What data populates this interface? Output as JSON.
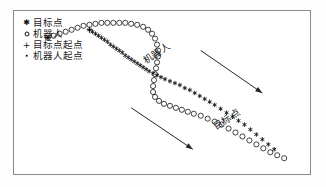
{
  "figure": {
    "background_color": "#ffffff",
    "frame_color": "#8a8a8a",
    "marker_color": "#111111"
  },
  "legend": {
    "items": [
      {
        "marker": "star-marker-icon",
        "label": "目标点"
      },
      {
        "marker": "circle-marker-icon",
        "label": "机器人"
      },
      {
        "marker": "plus-marker-icon",
        "label": "目标点起点"
      },
      {
        "marker": "dot-marker-icon",
        "label": "机器人起点"
      }
    ]
  },
  "annotations": [
    {
      "name": "robot-arrow",
      "label": "机器人"
    },
    {
      "name": "target-arrow",
      "label": "目标点"
    }
  ],
  "chart_data": {
    "type": "scatter",
    "title": "",
    "xlabel": "",
    "ylabel": "",
    "grid": false,
    "legend_position": "top-left",
    "xlim": [
      0,
      298
    ],
    "ylim": [
      0,
      165
    ],
    "series": [
      {
        "name": "目标点",
        "marker": "star",
        "color": "#111111",
        "points": [
          [
            76,
            146
          ],
          [
            79,
            144
          ],
          [
            82,
            142
          ],
          [
            85,
            140
          ],
          [
            88,
            138
          ],
          [
            91,
            136
          ],
          [
            94,
            134
          ],
          [
            97,
            131
          ],
          [
            100,
            129
          ],
          [
            103,
            127
          ],
          [
            106,
            125
          ],
          [
            109,
            123
          ],
          [
            112,
            120
          ],
          [
            115,
            118
          ],
          [
            118,
            116
          ],
          [
            121,
            114
          ],
          [
            124,
            112
          ],
          [
            127,
            110
          ],
          [
            130,
            108
          ],
          [
            133,
            106
          ],
          [
            136,
            104
          ],
          [
            140,
            102
          ],
          [
            144,
            100
          ],
          [
            148,
            98
          ],
          [
            152,
            96
          ],
          [
            157,
            94
          ],
          [
            162,
            92
          ],
          [
            167,
            90
          ],
          [
            172,
            87
          ],
          [
            177,
            85
          ],
          [
            182,
            82
          ],
          [
            187,
            79
          ],
          [
            192,
            76
          ],
          [
            197,
            73
          ],
          [
            202,
            70
          ],
          [
            208,
            66
          ],
          [
            214,
            62
          ],
          [
            220,
            58
          ],
          [
            226,
            54
          ],
          [
            232,
            50
          ],
          [
            238,
            45
          ],
          [
            244,
            40
          ],
          [
            250,
            35
          ],
          [
            256,
            30
          ],
          [
            262,
            25
          ]
        ]
      },
      {
        "name": "机器人",
        "marker": "circle",
        "color": "#111111",
        "points": [
          [
            34,
            138
          ],
          [
            40,
            140
          ],
          [
            46,
            142
          ],
          [
            52,
            144
          ],
          [
            58,
            146
          ],
          [
            64,
            148
          ],
          [
            70,
            150
          ],
          [
            76,
            151
          ],
          [
            82,
            152
          ],
          [
            88,
            153
          ],
          [
            94,
            153
          ],
          [
            100,
            153
          ],
          [
            106,
            153
          ],
          [
            112,
            153
          ],
          [
            118,
            152
          ],
          [
            124,
            151
          ],
          [
            130,
            149
          ],
          [
            135,
            146
          ],
          [
            139,
            142
          ],
          [
            142,
            137
          ],
          [
            144,
            131
          ],
          [
            145,
            125
          ],
          [
            145,
            119
          ],
          [
            144,
            113
          ],
          [
            143,
            107
          ],
          [
            142,
            101
          ],
          [
            141,
            95
          ],
          [
            140,
            89
          ],
          [
            140,
            83
          ],
          [
            142,
            78
          ],
          [
            146,
            74
          ],
          [
            151,
            71
          ],
          [
            157,
            69
          ],
          [
            163,
            67
          ],
          [
            169,
            65
          ],
          [
            175,
            63
          ],
          [
            181,
            61
          ],
          [
            188,
            59
          ],
          [
            195,
            56
          ],
          [
            202,
            53
          ],
          [
            209,
            50
          ],
          [
            216,
            46
          ],
          [
            223,
            42
          ],
          [
            230,
            38
          ],
          [
            237,
            34
          ],
          [
            244,
            30
          ],
          [
            251,
            26
          ],
          [
            258,
            22
          ],
          [
            265,
            19
          ],
          [
            272,
            16
          ]
        ]
      }
    ],
    "special_points": [
      {
        "name": "目标点起点",
        "marker": "plus",
        "x": 76,
        "y": 146
      },
      {
        "name": "机器人起点",
        "marker": "dot",
        "x": 34,
        "y": 138
      }
    ],
    "arrows": [
      {
        "name": "robot-arrow",
        "label": "机器人",
        "x1": 118,
        "y1": 67,
        "x2": 180,
        "y2": 25
      },
      {
        "name": "target-arrow",
        "label": "目标点",
        "x1": 188,
        "y1": 125,
        "x2": 250,
        "y2": 82
      }
    ]
  }
}
